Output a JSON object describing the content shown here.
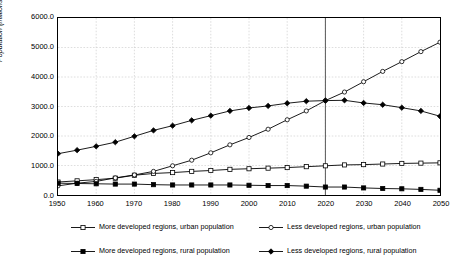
{
  "chart_data": {
    "type": "line",
    "title": "",
    "subtitle": "",
    "xlabel": "",
    "ylabel": "Population (millions)",
    "xlim": [
      1950,
      2050
    ],
    "ylim": [
      0,
      6000
    ],
    "grid": true,
    "legend_position": "bottom",
    "x_tick_labels": [
      "1950",
      "1960",
      "1970",
      "1980",
      "1990",
      "2000",
      "2010",
      "2020",
      "2030",
      "2040",
      "2050"
    ],
    "x_tick_values": [
      1950,
      1960,
      1970,
      1980,
      1990,
      2000,
      2010,
      2020,
      2030,
      2040,
      2050
    ],
    "y_tick_labels": [
      "0.0",
      "1000.0",
      "2000.0",
      "3000.0",
      "4000.0",
      "5000.0",
      "6000.0"
    ],
    "y_tick_values": [
      0,
      1000,
      2000,
      3000,
      4000,
      5000,
      6000
    ],
    "x": [
      1950,
      1955,
      1960,
      1965,
      1970,
      1975,
      1980,
      1985,
      1990,
      1995,
      2000,
      2005,
      2010,
      2015,
      2020,
      2025,
      2030,
      2035,
      2040,
      2045,
      2050
    ],
    "annotations": [
      {
        "name": "reference-line-2020",
        "type": "vline",
        "x": 2020,
        "label": ""
      }
    ],
    "series": [
      {
        "name": "More developed regions, urban population",
        "marker": "open-square",
        "values": [
          440,
          480,
          520,
          570,
          670,
          730,
          760,
          800,
          830,
          870,
          890,
          910,
          930,
          960,
          990,
          1020,
          1030,
          1050,
          1070,
          1080,
          1090
        ]
      },
      {
        "name": "Less developed regions, urban population",
        "marker": "open-circle",
        "values": [
          310,
          400,
          460,
          580,
          680,
          800,
          990,
          1180,
          1430,
          1700,
          1950,
          2230,
          2550,
          2850,
          3200,
          3490,
          3840,
          4190,
          4520,
          4860,
          5180
        ]
      },
      {
        "name": "More developed regions, rural population",
        "marker": "filled-square",
        "values": [
          400,
          390,
          380,
          370,
          370,
          350,
          340,
          340,
          340,
          340,
          330,
          320,
          320,
          300,
          270,
          270,
          240,
          220,
          210,
          190,
          160
        ]
      },
      {
        "name": "Less developed regions, rural population",
        "marker": "filled-diamond",
        "values": [
          1400,
          1520,
          1650,
          1790,
          1990,
          2190,
          2350,
          2530,
          2690,
          2850,
          2950,
          3020,
          3110,
          3180,
          3200,
          3210,
          3120,
          3060,
          2960,
          2850,
          2670
        ]
      }
    ]
  },
  "legend": {
    "entries": [
      {
        "label": "More developed regions, urban population",
        "marker": "open-square"
      },
      {
        "label": "Less developed regions, urban population",
        "marker": "open-circle"
      },
      {
        "label": "More developed regions, rural population",
        "marker": "filled-square"
      },
      {
        "label": "Less developed regions, rural population",
        "marker": "filled-diamond"
      }
    ]
  },
  "colors": {
    "line": "#000000",
    "grid": "#c8c8c8",
    "axis": "#000000",
    "reference_line": "#555555",
    "background": "#ffffff"
  }
}
